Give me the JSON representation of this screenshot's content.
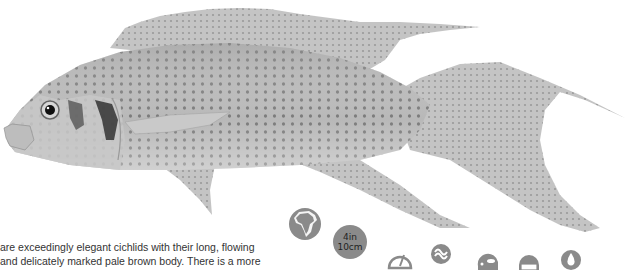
{
  "illustration": {
    "subject": "cichlid fish",
    "description": "Greyscale illustration of an elegant cichlid with long flowing fins and spotted body"
  },
  "body_text": {
    "lines": [
      "are exceedingly elegant cichlids with their long, flowing",
      "and delicately marked pale brown body. There is a more"
    ]
  },
  "icons": {
    "origin": "africa-globe-icon",
    "size_badge": {
      "imperial": "4in",
      "metric": "10cm"
    },
    "row": [
      "gauge-icon",
      "swimming-zone-icon",
      "fish-head-icon",
      "tank-icon",
      "water-drop-icon"
    ]
  },
  "colors": {
    "icon_grey": "#8a8a8a",
    "text": "#333333",
    "background": "#ffffff"
  }
}
